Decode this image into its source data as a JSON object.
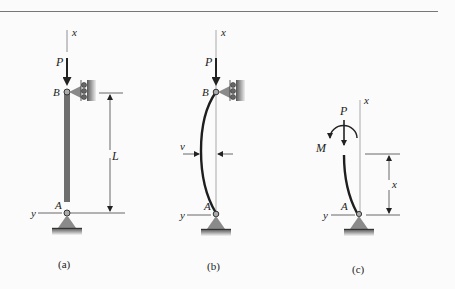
{
  "figure": {
    "panels": [
      {
        "id": "a",
        "caption": "(a)",
        "labels": {
          "axis_x": "x",
          "axis_y": "y",
          "load": "P",
          "top_support": "B",
          "bottom_support": "A",
          "length": "L"
        }
      },
      {
        "id": "b",
        "caption": "(b)",
        "labels": {
          "axis_x": "x",
          "axis_y": "y",
          "load": "P",
          "top_support": "B",
          "bottom_support": "A",
          "deflection": "v"
        }
      },
      {
        "id": "c",
        "caption": "(c)",
        "labels": {
          "axis_x": "x",
          "axis_y": "y",
          "load": "P",
          "moment": "M",
          "bottom_support": "A",
          "distance": "x"
        }
      }
    ],
    "colors": {
      "column": "#6e6e6e",
      "support": "#8a8a8a",
      "line": "#333333",
      "curve": "#1e1e1e"
    }
  }
}
